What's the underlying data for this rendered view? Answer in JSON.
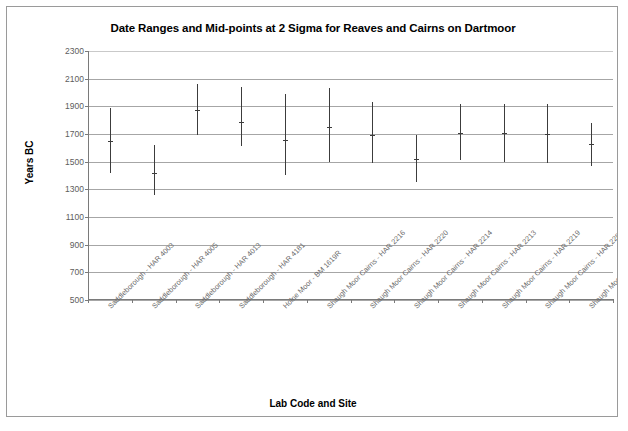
{
  "chart_data": {
    "type": "bar",
    "subtype": "floating-range-with-midpoint",
    "title": "Date Ranges and Mid-points at 2 Sigma for Reaves and Cairns on Dartmoor",
    "xlabel": "Lab Code and Site",
    "ylabel": "Years BC",
    "ylim": [
      500,
      2300
    ],
    "y_ticks": [
      2300,
      2100,
      1900,
      1700,
      1500,
      1300,
      1100,
      900,
      700,
      500
    ],
    "y_tick_labels": [
      "2300",
      "2100",
      "1900",
      "1700",
      "1500",
      "1300",
      "1100",
      "900",
      "700",
      "500"
    ],
    "grid": true,
    "grid_axis": "y",
    "legend": false,
    "y_axis_inverted": false,
    "categories": [
      "Saddleborough - HAR 4003",
      "Saddleborough - HAR 4005",
      "Saddleborough - HAR 4013",
      "Saddleborough - HAR 4181",
      "Holne Moor - BM 1619R",
      "Shaugh Moor Cairns - HAR 2216",
      "Shaugh Moor Cairns - HAR 2220",
      "Shaugh Moor Cairns - HAR 2214",
      "Shaugh Moor Cairns - HAR 2213",
      "Shaugh Moor Cairns - HAR 2219",
      "Shaugh Moor Cairns - HAR 2285",
      "Shaugh Moor Cairns - HAR 2221"
    ],
    "series": [
      {
        "name": "Range high (2 sigma)",
        "values": [
          1890,
          1620,
          2060,
          2040,
          1990,
          2030,
          1930,
          1690,
          1920,
          1920,
          1920,
          1780
        ]
      },
      {
        "name": "Mid-point",
        "values": [
          1650,
          1420,
          1870,
          1790,
          1660,
          1750,
          1690,
          1520,
          1710,
          1710,
          1700,
          1630
        ]
      },
      {
        "name": "Range low (2 sigma)",
        "values": [
          1420,
          1260,
          1690,
          1610,
          1400,
          1500,
          1490,
          1350,
          1510,
          1500,
          1490,
          1470
        ]
      }
    ],
    "series_colors": {
      "range_bar": "#3c3c3c",
      "mid_point": "#3c3c3c",
      "gridline": "#a6a6a6",
      "axis": "#7a7a7a"
    }
  },
  "footer": {
    "caption": ""
  }
}
